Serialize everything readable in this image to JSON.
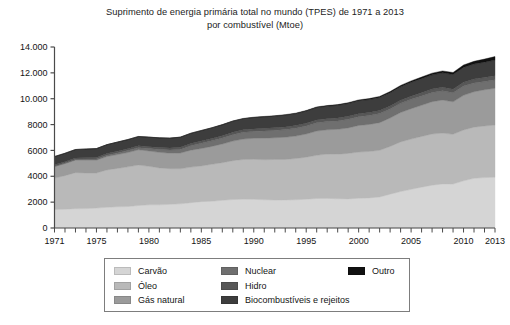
{
  "chart_data": {
    "type": "area",
    "title": "Suprimento de energia primária total no mundo (TPES) de 1971 a 2013",
    "subtitle": "por combustível (Mtoe)",
    "xlabel": "",
    "ylabel": "",
    "stacked": true,
    "grid": false,
    "legend_position": "bottom",
    "xlim": [
      1971,
      2013
    ],
    "ylim": [
      0,
      14000
    ],
    "ytick_labels": [
      "0",
      "2000",
      "4000",
      "6000",
      "8000",
      "10.000",
      "12.000",
      "14.000"
    ],
    "ytick_values": [
      0,
      2000,
      4000,
      6000,
      8000,
      10000,
      12000,
      14000
    ],
    "xtick_labels": [
      "1971",
      "1975",
      "1980",
      "1985",
      "1990",
      "1995",
      "2000",
      "2005",
      "2010",
      "2013"
    ],
    "xtick_values": [
      1971,
      1975,
      1980,
      1985,
      1990,
      1995,
      2000,
      2005,
      2010,
      2013
    ],
    "x": [
      1971,
      1972,
      1973,
      1974,
      1975,
      1976,
      1977,
      1978,
      1979,
      1980,
      1981,
      1982,
      1983,
      1984,
      1985,
      1986,
      1987,
      1988,
      1989,
      1990,
      1991,
      1992,
      1993,
      1994,
      1995,
      1996,
      1997,
      1998,
      1999,
      2000,
      2001,
      2002,
      2003,
      2004,
      2005,
      2006,
      2007,
      2008,
      2009,
      2010,
      2011,
      2012,
      2013
    ],
    "series": [
      {
        "name": "Carvão",
        "color": "#d5d5d5",
        "values": [
          1440,
          1450,
          1490,
          1500,
          1540,
          1600,
          1640,
          1660,
          1740,
          1790,
          1790,
          1830,
          1870,
          1960,
          2040,
          2070,
          2140,
          2200,
          2230,
          2220,
          2180,
          2160,
          2170,
          2180,
          2230,
          2280,
          2290,
          2260,
          2250,
          2300,
          2330,
          2400,
          2620,
          2820,
          2990,
          3160,
          3310,
          3410,
          3400,
          3650,
          3840,
          3900,
          3930
        ]
      },
      {
        "name": "Óleo",
        "color": "#b9b9b9",
        "values": [
          2420,
          2600,
          2790,
          2760,
          2720,
          2890,
          2970,
          3070,
          3130,
          2980,
          2860,
          2760,
          2710,
          2750,
          2760,
          2860,
          2910,
          3010,
          3070,
          3090,
          3100,
          3140,
          3130,
          3190,
          3250,
          3340,
          3430,
          3450,
          3520,
          3570,
          3590,
          3610,
          3690,
          3840,
          3890,
          3920,
          3960,
          3930,
          3850,
          3930,
          3960,
          3990,
          4030
        ]
      },
      {
        "name": "Gás natural",
        "color": "#9b9b9b",
        "values": [
          890,
          930,
          970,
          990,
          990,
          1040,
          1070,
          1110,
          1180,
          1190,
          1200,
          1200,
          1220,
          1310,
          1350,
          1380,
          1450,
          1510,
          1580,
          1630,
          1670,
          1680,
          1720,
          1740,
          1790,
          1880,
          1880,
          1920,
          1970,
          2060,
          2090,
          2140,
          2200,
          2270,
          2350,
          2410,
          2500,
          2560,
          2510,
          2680,
          2740,
          2800,
          2850
        ]
      },
      {
        "name": "Nuclear",
        "color": "#6f6f6f",
        "values": [
          29,
          38,
          47,
          64,
          85,
          100,
          130,
          150,
          160,
          186,
          220,
          240,
          280,
          340,
          400,
          430,
          460,
          500,
          520,
          530,
          560,
          570,
          590,
          600,
          620,
          640,
          630,
          650,
          670,
          680,
          690,
          700,
          690,
          710,
          720,
          720,
          710,
          710,
          700,
          720,
          680,
          640,
          650
        ]
      },
      {
        "name": "Hidro",
        "color": "#575757",
        "values": [
          104,
          109,
          112,
          121,
          124,
          124,
          131,
          138,
          143,
          148,
          152,
          155,
          166,
          172,
          177,
          182,
          184,
          190,
          190,
          194,
          199,
          199,
          207,
          209,
          217,
          223,
          225,
          228,
          231,
          232,
          226,
          229,
          230,
          240,
          250,
          258,
          265,
          276,
          280,
          296,
          302,
          315,
          325
        ]
      },
      {
        "name": "Biocombustíveis e rejeitos",
        "color": "#3d3d3d",
        "values": [
          640,
          650,
          660,
          670,
          680,
          690,
          700,
          710,
          720,
          730,
          745,
          760,
          775,
          790,
          805,
          820,
          835,
          850,
          860,
          880,
          890,
          900,
          915,
          925,
          940,
          955,
          965,
          980,
          990,
          1000,
          1010,
          1020,
          1035,
          1050,
          1070,
          1085,
          1100,
          1115,
          1125,
          1145,
          1160,
          1180,
          1200
        ]
      },
      {
        "name": "Outro",
        "color": "#111111",
        "values": [
          4,
          5,
          5,
          6,
          6,
          7,
          7,
          8,
          9,
          10,
          11,
          12,
          13,
          15,
          17,
          19,
          21,
          23,
          25,
          28,
          31,
          34,
          37,
          40,
          44,
          48,
          52,
          57,
          62,
          68,
          74,
          81,
          89,
          98,
          108,
          120,
          133,
          148,
          164,
          185,
          210,
          240,
          275
        ]
      }
    ],
    "legend": [
      {
        "label": "Carvão",
        "color": "#d5d5d5",
        "column": 1
      },
      {
        "label": "Óleo",
        "color": "#b9b9b9",
        "column": 1
      },
      {
        "label": "Gás natural",
        "color": "#9b9b9b",
        "column": 1
      },
      {
        "label": "Nuclear",
        "color": "#6f6f6f",
        "column": 2
      },
      {
        "label": "Hidro",
        "color": "#575757",
        "column": 2
      },
      {
        "label": "Biocombustíveis e rejeitos",
        "color": "#3d3d3d",
        "column": 2
      },
      {
        "label": "Outro",
        "color": "#111111",
        "column": 3
      }
    ],
    "axis_color": "#4a4a4a"
  }
}
